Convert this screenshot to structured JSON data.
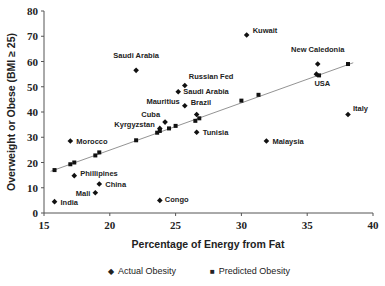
{
  "chart_data": {
    "type": "scatter",
    "title": "",
    "xlabel": "Percentage of Energy from Fat",
    "ylabel": "Overweight or Obese (BMI ≥ 25)",
    "xlim": [
      15,
      40
    ],
    "ylim": [
      0,
      80
    ],
    "x_ticks": [
      15,
      20,
      25,
      30,
      35,
      40
    ],
    "y_ticks": [
      0,
      10,
      20,
      30,
      40,
      50,
      60,
      70,
      80
    ],
    "grid": false,
    "legend_position": "bottom",
    "series": [
      {
        "name": "Actual Obesity",
        "marker": "diamond",
        "points": [
          {
            "label": "India",
            "x": 15.8,
            "y": 4.5
          },
          {
            "label": "Mali",
            "x": 18.9,
            "y": 8.0
          },
          {
            "label": "China",
            "x": 19.2,
            "y": 11.5
          },
          {
            "label": "Phillipines",
            "x": 17.3,
            "y": 14.8
          },
          {
            "label": "Morocco",
            "x": 17.0,
            "y": 28.5
          },
          {
            "label": "Congo",
            "x": 23.8,
            "y": 5.0
          },
          {
            "label": "Kyrgyzstan",
            "x": 23.8,
            "y": 33.5
          },
          {
            "label": "Cuba",
            "x": 24.2,
            "y": 36.0
          },
          {
            "label": "Mauritius",
            "x": 25.7,
            "y": 42.5
          },
          {
            "label": "Saudi Arabia",
            "x": 25.2,
            "y": 48.0
          },
          {
            "label": "Russian Fed",
            "x": 25.7,
            "y": 50.5
          },
          {
            "label": "Brazil",
            "x": 26.6,
            "y": 39.0
          },
          {
            "label": "Tunisia",
            "x": 26.6,
            "y": 32.0
          },
          {
            "label": "Saudi Arabia",
            "x": 22.0,
            "y": 56.5
          },
          {
            "label": "Kuwait",
            "x": 30.4,
            "y": 70.5
          },
          {
            "label": "Malaysia",
            "x": 31.9,
            "y": 28.5
          },
          {
            "label": "New Caledonia",
            "x": 35.8,
            "y": 59.0
          },
          {
            "label": "USA",
            "x": 35.7,
            "y": 55.0
          },
          {
            "label": "Italy",
            "x": 38.1,
            "y": 39.0
          }
        ]
      },
      {
        "name": "Predicted Obesity",
        "marker": "square",
        "points": [
          {
            "x": 15.8,
            "y": 17.0
          },
          {
            "x": 17.0,
            "y": 19.3
          },
          {
            "x": 17.3,
            "y": 20.0
          },
          {
            "x": 18.9,
            "y": 22.8
          },
          {
            "x": 19.2,
            "y": 24.0
          },
          {
            "x": 22.0,
            "y": 28.8
          },
          {
            "x": 23.6,
            "y": 31.8
          },
          {
            "x": 23.8,
            "y": 32.5
          },
          {
            "x": 24.5,
            "y": 33.5
          },
          {
            "x": 25.0,
            "y": 34.5
          },
          {
            "x": 26.5,
            "y": 36.5
          },
          {
            "x": 26.8,
            "y": 37.5
          },
          {
            "x": 30.0,
            "y": 44.5
          },
          {
            "x": 31.3,
            "y": 46.8
          },
          {
            "x": 35.9,
            "y": 54.5
          },
          {
            "x": 38.1,
            "y": 59.0
          }
        ]
      }
    ],
    "trendline": {
      "x": [
        15.5,
        38.5
      ],
      "y": [
        16.5,
        59.5
      ]
    }
  },
  "legend": {
    "actual_label": "Actual Obesity",
    "predicted_label": "Predicted Obesity",
    "actual_symbol": "◆",
    "predicted_symbol": "■"
  }
}
